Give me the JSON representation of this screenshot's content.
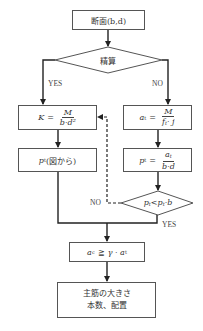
{
  "flowchart": {
    "start": {
      "label": "断面(b,d)"
    },
    "decision_main": {
      "label": "精算",
      "yes": "YES",
      "no": "NO"
    },
    "left_branch": {
      "box1": {
        "lhs": "K",
        "eq": "=",
        "num": "M",
        "den": "b·d²"
      },
      "box2": {
        "label": "p",
        "sub": "t",
        "suffix": "(図から)"
      }
    },
    "right_branch": {
      "box1": {
        "lhs": "a",
        "lhs_sub": "t",
        "eq": "=",
        "num": "M",
        "den_main": "f",
        "den_sub": "t",
        "den_rest": "· j"
      },
      "box2": {
        "lhs": "p",
        "lhs_sub": "t",
        "eq": "=",
        "num": "a",
        "num_sub": "t",
        "den": "b·d"
      },
      "decision": {
        "p1": "p",
        "p1_sub": "t",
        "op": "<",
        "p2": "p",
        "p2_sub": "t",
        "rest": "·b",
        "no": "NO",
        "yes": "YES"
      }
    },
    "check": {
      "lhs": "a",
      "lhs_sub": "c",
      "op": "≧",
      "rhs": "γ · a",
      "rhs_sub": "t"
    },
    "result": {
      "line1": "主筋の大きさ",
      "line2": "本数、配置"
    }
  },
  "colors": {
    "line": "#333333",
    "border": "#555555",
    "background": "#ffffff"
  }
}
